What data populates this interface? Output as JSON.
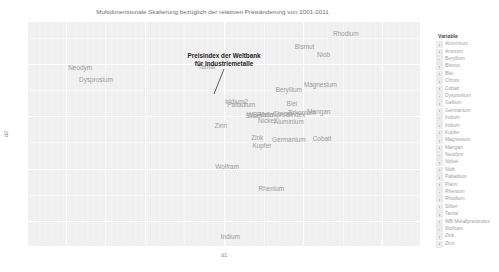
{
  "chart_data": {
    "type": "scatter",
    "title": "Multidimensionale Skalierung bezüglich der relativen Preisänderung von 2001-2011",
    "xlabel": "d1",
    "ylabel": "d2",
    "grid": true,
    "legend_position": "right",
    "legend_title": "Variable",
    "xlim": [
      -0.62,
      0.62
    ],
    "ylim": [
      -0.62,
      0.45
    ],
    "annotation": {
      "line1": "Preisindex der Weltbank",
      "line2": "für Industriemetalle",
      "target": "WB Metallpreisindex"
    },
    "points": [
      {
        "label": "Rhodium",
        "x": 0.385,
        "y": 0.395
      },
      {
        "label": "Bismut",
        "x": 0.255,
        "y": 0.33
      },
      {
        "label": "Niob",
        "x": 0.315,
        "y": 0.29
      },
      {
        "label": "Neodym",
        "x": -0.455,
        "y": 0.23
      },
      {
        "label": "Tantal",
        "x": -0.055,
        "y": 0.235
      },
      {
        "label": "Dysprosium",
        "x": -0.405,
        "y": 0.175
      },
      {
        "label": "Magnesium",
        "x": 0.305,
        "y": 0.15
      },
      {
        "label": "Beryllium",
        "x": 0.205,
        "y": 0.125
      },
      {
        "label": "Iridium2",
        "x": 0.04,
        "y": 0.07
      },
      {
        "label": "Palladium",
        "x": 0.055,
        "y": 0.055
      },
      {
        "label": "Blei",
        "x": 0.215,
        "y": 0.06
      },
      {
        "label": "Mangan",
        "x": 0.3,
        "y": 0.02
      },
      {
        "label": "Chrom",
        "x": 0.185,
        "y": 0.01
      },
      {
        "label": "Zirkonium",
        "x": 0.245,
        "y": 0.015
      },
      {
        "label": "Platin",
        "x": 0.13,
        "y": 0.005
      },
      {
        "label": "WB Metallpreisindex",
        "x": 0.165,
        "y": 0.005
      },
      {
        "label": "Silber",
        "x": 0.095,
        "y": 0.0
      },
      {
        "label": "Nickel",
        "x": 0.135,
        "y": -0.025
      },
      {
        "label": "Aluminium",
        "x": 0.205,
        "y": -0.03
      },
      {
        "label": "Zinn",
        "x": -0.01,
        "y": -0.045
      },
      {
        "label": "Germanium",
        "x": 0.205,
        "y": -0.115
      },
      {
        "label": "Cobalt",
        "x": 0.31,
        "y": -0.11
      },
      {
        "label": "Zink",
        "x": 0.105,
        "y": -0.105
      },
      {
        "label": "Kupfer",
        "x": 0.12,
        "y": -0.14
      },
      {
        "label": "Wolfram",
        "x": 0.01,
        "y": -0.245
      },
      {
        "label": "Rhenium",
        "x": 0.15,
        "y": -0.35
      },
      {
        "label": "Indium",
        "x": 0.02,
        "y": -0.575
      }
    ],
    "legend_entries": [
      "Aluminium",
      "Antimon",
      "Beryllium",
      "Bismut",
      "Blei",
      "Chrom",
      "Cobalt",
      "Dysprosium",
      "Gallium",
      "Germanium",
      "Indium",
      "Iridium",
      "Kupfer",
      "Magnesium",
      "Mangan",
      "Neodym",
      "Nickel",
      "Niob",
      "Palladium",
      "Platin",
      "Rhenium",
      "Rhodium",
      "Silber",
      "Tantal",
      "WB Metallpreisindex",
      "Wolfram",
      "Zink",
      "Zinn"
    ]
  }
}
